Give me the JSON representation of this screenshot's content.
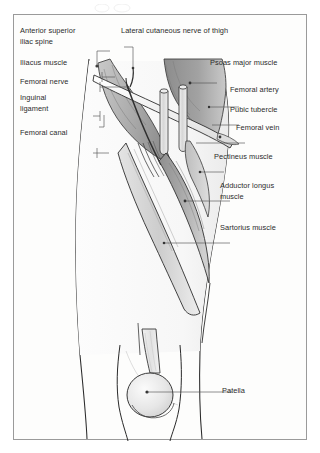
{
  "figure": {
    "frame_border_color": "#9a9a9a",
    "background_color": "#fdfdfc"
  },
  "palette": {
    "outline": "#1f1f1f",
    "psoas_major": "#9a9a9a",
    "iliacus": "#b4b4b4",
    "adductor_longus": "#a8a8a8",
    "pectineus": "#c2c2c2",
    "sartorius": "#d8d8d8",
    "vessel_fill": "#e8e8e8",
    "ligament_fill": "#f2f2f2",
    "leader_line": "#555555",
    "label_text": "#2b2b2b"
  },
  "labels": {
    "left": [
      {
        "id": "anterior-superior-iliac-spine",
        "text": "Anterior superior\niliac spine",
        "x": 19,
        "y": 25
      },
      {
        "id": "iliacus-muscle",
        "text": "Iliacus muscle",
        "x": 19,
        "y": 57
      },
      {
        "id": "femoral-nerve",
        "text": "Femoral nerve",
        "x": 19,
        "y": 76
      },
      {
        "id": "inguinal-ligament",
        "text": "Inguinal\nligament",
        "x": 19,
        "y": 92
      },
      {
        "id": "femoral-canal",
        "text": "Femoral canal",
        "x": 19,
        "y": 127
      }
    ],
    "top": [
      {
        "id": "lateral-cutaneous-nerve-of-thigh",
        "text": "Lateral cutaneous nerve of thigh",
        "x": 120,
        "y": 25
      }
    ],
    "right": [
      {
        "id": "psoas-major-muscle",
        "text": "Psoas major muscle",
        "x": 209,
        "y": 57
      },
      {
        "id": "femoral-artery",
        "text": "Femoral artery",
        "x": 229,
        "y": 84
      },
      {
        "id": "pubic-tubercle",
        "text": "Pubic tubercle",
        "x": 229,
        "y": 104
      },
      {
        "id": "femoral-vein",
        "text": "Femoral vein",
        "x": 235,
        "y": 122
      },
      {
        "id": "pectineus-muscle",
        "text": "Pectineus muscle",
        "x": 213,
        "y": 151
      },
      {
        "id": "adductor-longus-muscle",
        "text": "Adductor longus\nmuscle",
        "x": 219,
        "y": 180
      },
      {
        "id": "sartorius-muscle",
        "text": "Sartorius muscle",
        "x": 219,
        "y": 222
      },
      {
        "id": "patella",
        "text": "Patella",
        "x": 221,
        "y": 385
      }
    ]
  },
  "structures": [
    "anterior superior iliac spine",
    "iliacus muscle",
    "psoas major muscle",
    "lateral cutaneous nerve of thigh",
    "femoral nerve",
    "inguinal ligament",
    "femoral artery",
    "femoral vein",
    "femoral canal",
    "pubic tubercle",
    "pectineus muscle",
    "adductor longus muscle",
    "sartorius muscle",
    "patella"
  ]
}
